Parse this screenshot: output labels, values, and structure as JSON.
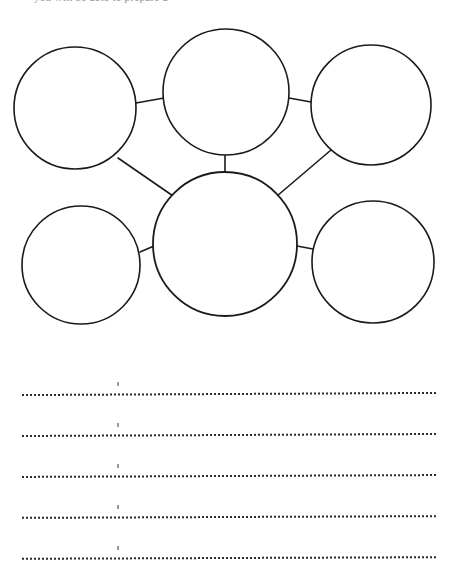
{
  "document": {
    "type": "worksheet",
    "title": "Bubble Map Graphic Organizer",
    "background_color": "#ffffff",
    "ink_color": "#1a1a1a",
    "width": 458,
    "height": 583
  },
  "top_sliver": {
    "clipped_text": "you will be able to prepare a",
    "color": "#8c8c92",
    "note": "partially cropped line of text at the very top edge"
  },
  "diagram": {
    "name": "bubble-map",
    "stroke_color": "#1a1a1a",
    "fill_color": "#ffffff",
    "bubbles": [
      {
        "id": "top-left",
        "label": "",
        "cx": 75,
        "cy": 94,
        "r": 61,
        "stroke_width": 1.6
      },
      {
        "id": "top-center",
        "label": "",
        "cx": 226,
        "cy": 78,
        "r": 63,
        "stroke_width": 1.6
      },
      {
        "id": "top-right",
        "label": "",
        "cx": 371,
        "cy": 91,
        "r": 60,
        "stroke_width": 1.6
      },
      {
        "id": "center-hub",
        "label": "",
        "cx": 225,
        "cy": 230,
        "r": 72,
        "stroke_width": 1.8
      },
      {
        "id": "bottom-left",
        "label": "",
        "cx": 81,
        "cy": 251,
        "r": 59,
        "stroke_width": 1.6
      },
      {
        "id": "bottom-right",
        "label": "",
        "cx": 373,
        "cy": 248,
        "r": 61,
        "stroke_width": 1.6
      }
    ],
    "connectors": [
      {
        "id": "top-left--top-center",
        "from": "top-left",
        "to": "top-center",
        "stroke_width": 1.6
      },
      {
        "id": "top-center--top-right",
        "from": "top-center",
        "to": "top-right",
        "stroke_width": 1.6
      },
      {
        "id": "top-left--center-hub",
        "from": "top-left",
        "to": "center-hub",
        "stroke_width": 1.6
      },
      {
        "id": "top-center--center-hub",
        "from": "top-center",
        "to": "center-hub",
        "stroke_width": 1.6
      },
      {
        "id": "top-right--center-hub",
        "from": "top-right",
        "to": "center-hub",
        "stroke_width": 1.6
      },
      {
        "id": "bottom-left--center-hub",
        "from": "bottom-left",
        "to": "center-hub",
        "stroke_width": 1.6
      },
      {
        "id": "center-hub--bottom-right",
        "from": "center-hub",
        "to": "bottom-right",
        "stroke_width": 1.6
      }
    ]
  },
  "writing_lines": {
    "name": "answer-lines",
    "count": 5,
    "style": "dotted",
    "color": "#2b2b2b",
    "tick_color": "#9a9a9e",
    "lines": [
      {
        "index": 1,
        "text": ""
      },
      {
        "index": 2,
        "text": ""
      },
      {
        "index": 3,
        "text": ""
      },
      {
        "index": 4,
        "text": ""
      },
      {
        "index": 5,
        "text": ""
      }
    ]
  }
}
